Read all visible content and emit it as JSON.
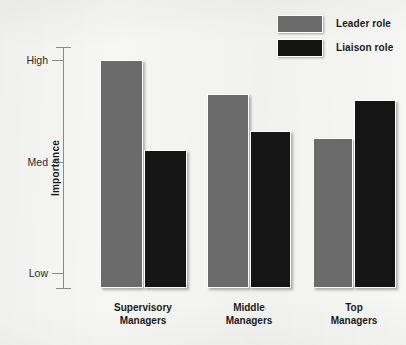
{
  "chart_data": {
    "type": "bar",
    "title": "",
    "subtitle": "",
    "xlabel": "",
    "ylabel": "Importance",
    "categories": [
      "Supervisory Managers",
      "Middle Managers",
      "Top Managers"
    ],
    "category_lines": [
      [
        "Supervisory",
        "Managers"
      ],
      [
        "Middle",
        "Managers"
      ],
      [
        "Top",
        "Managers"
      ]
    ],
    "series": [
      {
        "name": "Leader role",
        "color": "#6b6b6b",
        "values": [
          1.0,
          0.84,
          0.66
        ],
        "value_labels": [
          "High",
          "Med-High",
          "Med-High"
        ]
      },
      {
        "name": "Liaison role",
        "color": "#151515",
        "values": [
          0.61,
          0.69,
          0.83
        ],
        "value_labels": [
          "Med",
          "Med-High",
          "High"
        ]
      }
    ],
    "ylim": [
      0,
      1.12
    ],
    "ytick_values": [
      0.0,
      0.5,
      1.0
    ],
    "ytick_labels": [
      "Low",
      "Med",
      "High"
    ],
    "grid": false,
    "legend_position": "top-right",
    "annotations": []
  },
  "legend": {
    "items": [
      {
        "label": "Leader role",
        "swatch": "leader-swatch"
      },
      {
        "label": "Liaison role",
        "swatch": "liaison-swatch"
      }
    ]
  },
  "axis": {
    "ylabel": "Importance",
    "ticks": [
      {
        "label": "High",
        "y": 60
      },
      {
        "label": "Med",
        "y": 162
      },
      {
        "label": "Low",
        "y": 273
      }
    ]
  },
  "groups": [
    {
      "line1": "Supervisory",
      "line2": "Managers",
      "center_x": 143,
      "bars": [
        {
          "series": "Leader role",
          "x": 100,
          "width": 43,
          "top": 60
        },
        {
          "series": "Liaison role",
          "x": 144,
          "width": 43,
          "top": 150
        }
      ]
    },
    {
      "line1": "Middle",
      "line2": "Managers",
      "center_x": 249,
      "bars": [
        {
          "series": "Leader role",
          "x": 207,
          "width": 42,
          "top": 94
        },
        {
          "series": "Liaison role",
          "x": 250,
          "width": 41,
          "top": 131
        }
      ]
    },
    {
      "line1": "Top",
      "line2": "Managers",
      "center_x": 354,
      "bars": [
        {
          "series": "Leader role",
          "x": 313,
          "width": 40,
          "top": 138
        },
        {
          "series": "Liaison role",
          "x": 354,
          "width": 42,
          "top": 100
        }
      ]
    }
  ],
  "baseline_y": 288,
  "colors": {
    "leader": "#6b6b6b",
    "liaison": "#151515",
    "axis": "#8a8a8a",
    "text": "#1a1a1a",
    "background": "#f6f6f4"
  }
}
